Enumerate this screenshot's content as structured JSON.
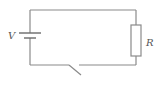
{
  "diagram": {
    "type": "circuit",
    "components": {
      "battery": {
        "label": "V"
      },
      "resistor": {
        "label": "R"
      },
      "switch": {
        "state": "open"
      }
    },
    "colors": {
      "wire": "#8a8a8a",
      "background": "#ffffff"
    }
  }
}
